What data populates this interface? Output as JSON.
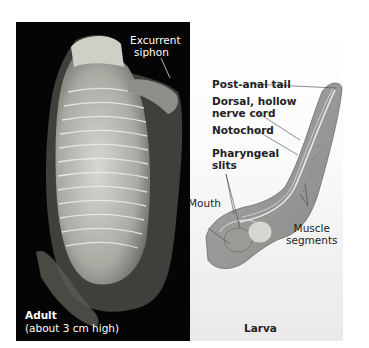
{
  "figure": {
    "adult_panel": {
      "background": "#050505",
      "callouts": {
        "excurrent_siphon": [
          "Excurrent",
          "siphon"
        ]
      },
      "caption_title": "Adult",
      "caption_note": "(about 3 cm high)"
    },
    "larva_panel": {
      "background": "#f3f3f3",
      "callouts": {
        "post_anal_tail": "Post-anal tail",
        "dorsal_nerve_cord": [
          "Dorsal, hollow",
          "nerve cord"
        ],
        "notochord": "Notochord",
        "pharyngeal_slits": [
          "Pharyngeal",
          "slits"
        ],
        "mouth": "Mouth",
        "muscle_segments": [
          "Muscle",
          "segments"
        ]
      },
      "caption_title": "Larva"
    }
  }
}
